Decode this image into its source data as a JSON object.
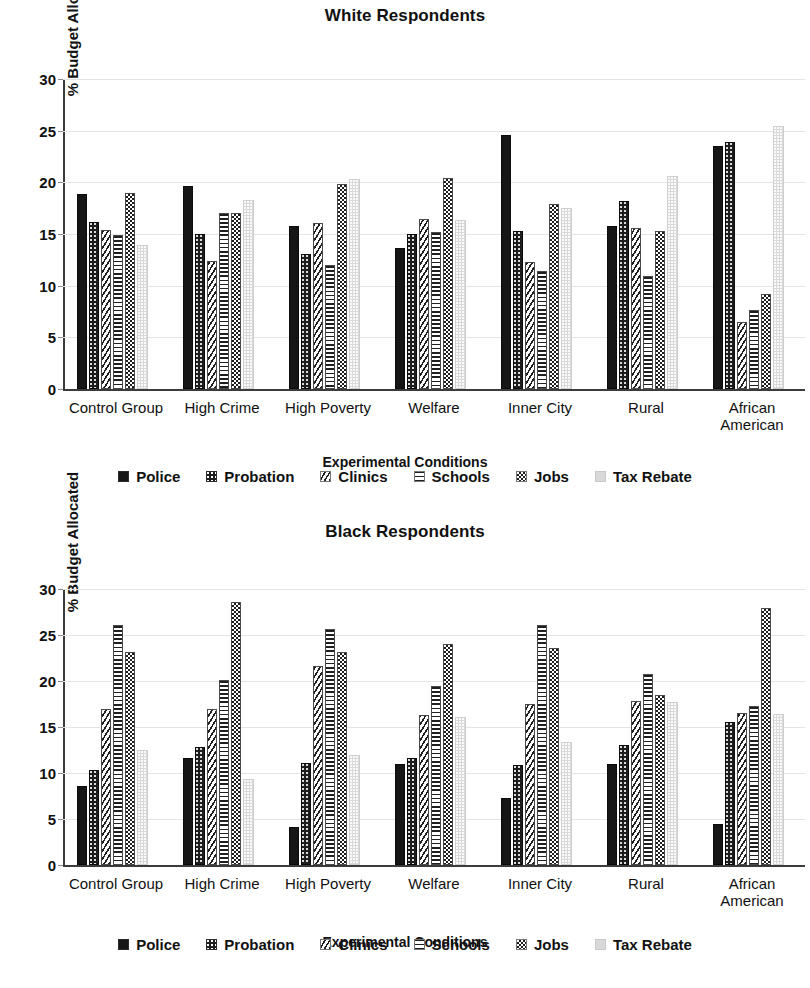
{
  "charts": [
    {
      "id": "white",
      "title": "White Respondents",
      "xlabel": "Experimental Conditions",
      "ylabel": "% Budget Allocated"
    },
    {
      "id": "black",
      "title": "Black Respondents",
      "xlabel": "Experimental Conditions",
      "ylabel": "% Budget Allocated"
    }
  ],
  "legend": {
    "items": [
      {
        "label": "Police",
        "pattern": "solid-black"
      },
      {
        "label": "Probation",
        "pattern": "black-dotted"
      },
      {
        "label": "Clinics",
        "pattern": "diagonal-hatch"
      },
      {
        "label": "Schools",
        "pattern": "horizontal-hatch"
      },
      {
        "label": "Jobs",
        "pattern": "checkerboard"
      },
      {
        "label": "Tax Rebate",
        "pattern": "light-gray"
      }
    ]
  },
  "yticks": [
    "0",
    "5",
    "10",
    "15",
    "20",
    "25",
    "30"
  ],
  "chart_data": [
    {
      "type": "bar",
      "title": "White Respondents",
      "xlabel": "Experimental Conditions",
      "ylabel": "% Budget Allocated",
      "ylim": [
        0,
        30
      ],
      "ytick_step": 5,
      "grid": true,
      "legend_position": "bottom",
      "categories": [
        "Control Group",
        "High Crime",
        "High Poverty",
        "Welfare",
        "Inner City",
        "Rural",
        "African American"
      ],
      "series": [
        {
          "name": "Police",
          "values": [
            18.9,
            19.6,
            15.8,
            13.6,
            24.6,
            15.8,
            23.5
          ]
        },
        {
          "name": "Probation",
          "values": [
            16.2,
            15.0,
            13.1,
            15.0,
            15.3,
            18.2,
            23.9
          ]
        },
        {
          "name": "Clinics",
          "values": [
            15.4,
            12.4,
            16.1,
            16.5,
            12.3,
            15.6,
            6.5
          ]
        },
        {
          "name": "Schools",
          "values": [
            14.9,
            17.0,
            12.0,
            15.2,
            11.4,
            10.9,
            7.6
          ]
        },
        {
          "name": "Jobs",
          "values": [
            19.0,
            17.0,
            19.8,
            20.4,
            17.9,
            15.3,
            9.2
          ]
        },
        {
          "name": "Tax Rebate",
          "values": [
            13.9,
            18.3,
            20.3,
            16.4,
            17.5,
            20.6,
            25.5
          ]
        }
      ]
    },
    {
      "type": "bar",
      "title": "Black Respondents",
      "xlabel": "Experimental Conditions",
      "ylabel": "% Budget Allocated",
      "ylim": [
        0,
        30
      ],
      "ytick_step": 5,
      "grid": true,
      "legend_position": "bottom",
      "categories": [
        "Control Group",
        "High Crime",
        "High Poverty",
        "Welfare",
        "Inner City",
        "Rural",
        "African American"
      ],
      "series": [
        {
          "name": "Police",
          "values": [
            8.6,
            11.6,
            4.1,
            11.0,
            7.3,
            11.0,
            4.5
          ]
        },
        {
          "name": "Probation",
          "values": [
            10.3,
            12.8,
            11.1,
            11.6,
            10.9,
            13.0,
            15.5
          ]
        },
        {
          "name": "Clinics",
          "values": [
            17.0,
            17.0,
            21.6,
            16.3,
            17.5,
            17.8,
            16.5
          ]
        },
        {
          "name": "Schools",
          "values": [
            26.1,
            20.1,
            25.7,
            19.5,
            26.1,
            20.8,
            17.3
          ]
        },
        {
          "name": "Jobs",
          "values": [
            23.1,
            28.6,
            23.1,
            24.0,
            23.6,
            18.5,
            27.9
          ]
        },
        {
          "name": "Tax Rebate",
          "values": [
            12.5,
            9.3,
            12.0,
            16.1,
            13.4,
            17.7,
            16.4
          ]
        }
      ]
    }
  ]
}
